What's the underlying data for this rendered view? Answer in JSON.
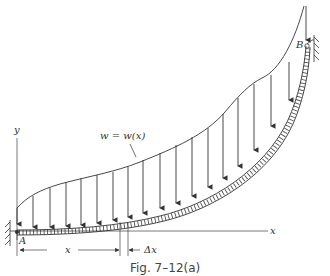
{
  "figure": {
    "caption": "Fig. 7–12(a)",
    "load_label": "w = w(x)",
    "axis_x_label": "x",
    "axis_y_label": "y",
    "support_a_label": "A",
    "support_b_label": "B",
    "dim_x_label": "x",
    "dim_dx_label": "Δx"
  },
  "colors": {
    "line": "#333333",
    "background": "#ffffff"
  }
}
